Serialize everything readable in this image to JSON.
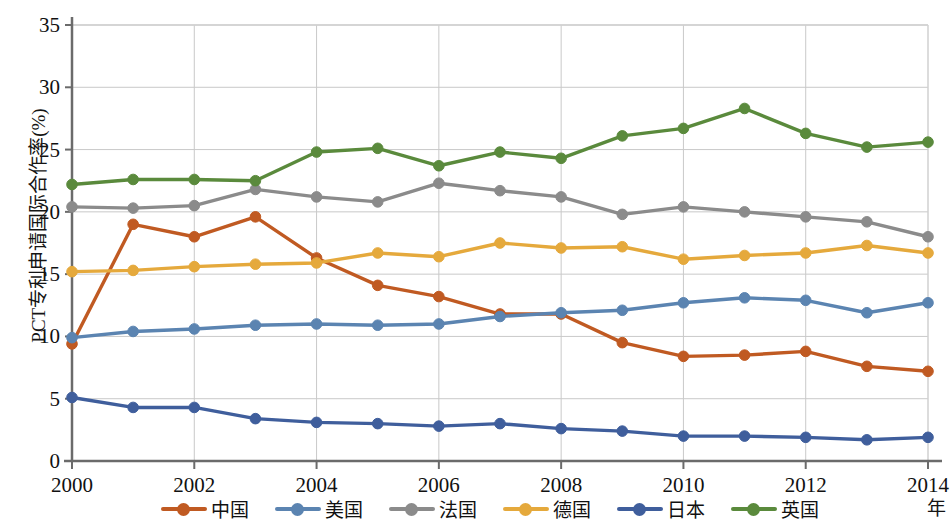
{
  "chart_data": {
    "type": "line",
    "title": "",
    "xlabel": "年",
    "ylabel": "PCT专利申请国际合作率(%)",
    "xlim": [
      2000,
      2014
    ],
    "ylim": [
      0,
      35
    ],
    "ytick_step": 5,
    "xtick_step": 2,
    "grid": true,
    "legend_position": "bottom",
    "x": [
      2000,
      2001,
      2002,
      2003,
      2004,
      2005,
      2006,
      2007,
      2008,
      2009,
      2010,
      2011,
      2012,
      2013,
      2014
    ],
    "xticks": [
      "2000",
      "2002",
      "2004",
      "2006",
      "2008",
      "2010",
      "2012",
      "2014"
    ],
    "yticks": [
      "0",
      "5",
      "10",
      "15",
      "20",
      "25",
      "30",
      "35"
    ],
    "series": [
      {
        "name": "中国",
        "color": "#c05a22",
        "values": [
          9.4,
          19.0,
          18.0,
          19.6,
          16.3,
          14.1,
          13.2,
          11.8,
          11.8,
          9.5,
          8.4,
          8.5,
          8.8,
          7.6,
          7.2
        ]
      },
      {
        "name": "美国",
        "color": "#5b84b1",
        "values": [
          9.9,
          10.4,
          10.6,
          10.9,
          11.0,
          10.9,
          11.0,
          11.6,
          11.9,
          12.1,
          12.7,
          13.1,
          12.9,
          11.9,
          12.7
        ]
      },
      {
        "name": "法国",
        "color": "#8b8b8b",
        "values": [
          20.4,
          20.3,
          20.5,
          21.8,
          21.2,
          20.8,
          22.3,
          21.7,
          21.2,
          19.8,
          20.4,
          20.0,
          19.6,
          19.2,
          18.0
        ]
      },
      {
        "name": "德国",
        "color": "#e5a93c",
        "values": [
          15.2,
          15.3,
          15.6,
          15.8,
          15.9,
          16.7,
          16.4,
          17.5,
          17.1,
          17.2,
          16.2,
          16.5,
          16.7,
          17.3,
          16.7
        ]
      },
      {
        "name": "日本",
        "color": "#3f5e9c",
        "values": [
          5.1,
          4.3,
          4.3,
          3.4,
          3.1,
          3.0,
          2.8,
          3.0,
          2.6,
          2.4,
          2.0,
          2.0,
          1.9,
          1.7,
          1.9
        ]
      },
      {
        "name": "英国",
        "color": "#5a8a3c",
        "values": [
          22.2,
          22.6,
          22.6,
          22.5,
          24.8,
          25.1,
          23.7,
          24.8,
          24.3,
          26.1,
          26.7,
          28.3,
          26.3,
          25.2,
          25.6
        ]
      }
    ]
  },
  "axes": {
    "y_title": "PCT专利申请国际合作率(%)",
    "x_title": "年"
  }
}
